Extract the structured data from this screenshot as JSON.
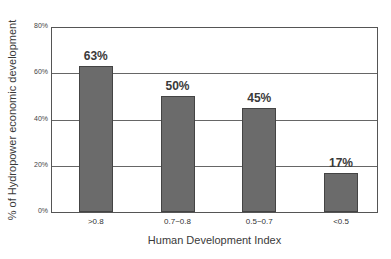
{
  "chart_data": {
    "type": "bar",
    "title": "",
    "xlabel": "Human Development Index",
    "ylabel": "% of Hydropower economic development",
    "categories": [
      ">0.8",
      "0.7~0.8",
      "0.5~0.7",
      "<0.5"
    ],
    "values": [
      63,
      50,
      45,
      17
    ],
    "value_labels": [
      "63%",
      "50%",
      "45%",
      "17%"
    ],
    "yticks": [
      "0%",
      "20%",
      "40%",
      "60%",
      "80%"
    ],
    "ylim": [
      0,
      80
    ],
    "grid": true,
    "legend": null,
    "bar_color": "#6b6b6b"
  }
}
